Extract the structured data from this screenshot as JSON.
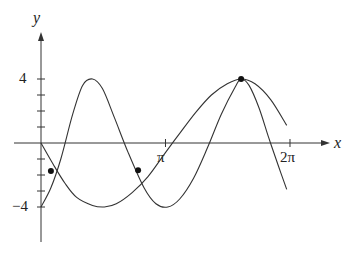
{
  "chart_data": {
    "type": "line",
    "title": "",
    "xlabel": "x",
    "ylabel": "y",
    "x_ticks": [
      {
        "value": 3.14159,
        "label": "π"
      },
      {
        "value": 6.28318,
        "label": "2π"
      }
    ],
    "y_ticks": [
      {
        "value": 4,
        "label": "4"
      },
      {
        "value": -4,
        "label": "-4"
      }
    ],
    "y_minor_ticks": [
      -4,
      -3,
      -2,
      -1,
      1,
      2,
      3,
      4
    ],
    "xlim": [
      0,
      6.9
    ],
    "ylim": [
      -6.2,
      7.4
    ],
    "grid": false,
    "legend": null,
    "series": [
      {
        "name": "curve-a",
        "description": "faster oscillating curve starting at (0,-4)",
        "points": [
          [
            0,
            -4
          ],
          [
            0.25,
            -2.8
          ],
          [
            0.5,
            -1.0
          ],
          [
            0.8,
            1.8
          ],
          [
            1.05,
            3.6
          ],
          [
            1.3,
            4.0
          ],
          [
            1.55,
            3.4
          ],
          [
            1.85,
            1.6
          ],
          [
            2.2,
            -0.6
          ],
          [
            2.6,
            -2.8
          ],
          [
            2.9,
            -3.8
          ],
          [
            3.2,
            -4.0
          ],
          [
            3.5,
            -3.5
          ],
          [
            3.85,
            -2.2
          ],
          [
            4.2,
            -0.3
          ],
          [
            4.55,
            1.8
          ],
          [
            4.9,
            3.5
          ],
          [
            5.05,
            4.0
          ],
          [
            5.25,
            3.6
          ],
          [
            5.5,
            2.2
          ],
          [
            5.75,
            0.3
          ],
          [
            6.0,
            -1.5
          ],
          [
            6.2,
            -2.9
          ]
        ]
      },
      {
        "name": "curve-b",
        "description": "slower curve starting at (0,0)",
        "points": [
          [
            0,
            0
          ],
          [
            0.3,
            -1.3
          ],
          [
            0.6,
            -2.5
          ],
          [
            0.9,
            -3.4
          ],
          [
            1.3,
            -3.9
          ],
          [
            1.6,
            -4.0
          ],
          [
            1.9,
            -3.8
          ],
          [
            2.3,
            -3.1
          ],
          [
            2.7,
            -2.1
          ],
          [
            3.14,
            -0.6
          ],
          [
            3.5,
            0.6
          ],
          [
            3.9,
            1.9
          ],
          [
            4.3,
            3.0
          ],
          [
            4.7,
            3.7
          ],
          [
            5.05,
            4.0
          ],
          [
            5.4,
            3.7
          ],
          [
            5.8,
            2.7
          ],
          [
            6.2,
            1.1
          ]
        ]
      }
    ],
    "marked_points": [
      {
        "x": 0.25,
        "y": -1.75
      },
      {
        "x": 2.45,
        "y": -1.7
      },
      {
        "x": 5.05,
        "y": 4.0
      }
    ]
  },
  "labels": {
    "x_axis": "x",
    "y_axis": "y",
    "pi": "π",
    "two_pi": "2π",
    "four": "4",
    "neg_four": "−4"
  }
}
